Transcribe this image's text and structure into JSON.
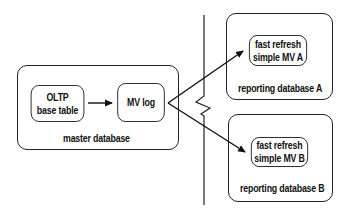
{
  "diagram": {
    "master_db": {
      "label": "master database",
      "oltp": {
        "line1": "OLTP",
        "line2": "base table"
      },
      "mv_log": {
        "label": "MV log"
      }
    },
    "reporting_a": {
      "label": "reporting database A",
      "mv": {
        "line1": "fast refresh",
        "line2": "simple MV A"
      }
    },
    "reporting_b": {
      "label": "reporting database B",
      "mv": {
        "line1": "fast refresh",
        "line2": "simple MV B"
      }
    },
    "edges": [
      {
        "from": "OLTP base table",
        "to": "MV log"
      },
      {
        "from": "MV log",
        "to": "fast refresh simple MV A"
      },
      {
        "from": "MV log",
        "to": "fast refresh simple MV B"
      }
    ],
    "divider": "network boundary (vertical line with break)"
  }
}
